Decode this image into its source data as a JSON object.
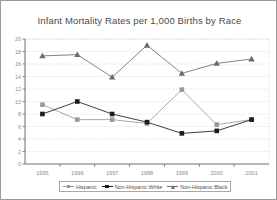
{
  "chart_data": {
    "type": "line",
    "title": "Infant Mortality Rates per 1,000 Births by Race",
    "xlabel": "",
    "ylabel": "",
    "categories": [
      "1995",
      "1996",
      "1997",
      "1998",
      "1999",
      "2000",
      "2001"
    ],
    "ylim": [
      0,
      20
    ],
    "yticks": [
      "0",
      "2",
      "4",
      "6",
      "8",
      "10",
      "12",
      "14",
      "16",
      "18",
      "20"
    ],
    "grid": true,
    "legend_position": "bottom",
    "series": [
      {
        "name": "Hispanic",
        "marker": "square",
        "color": "#9a9a9a",
        "values": [
          9.5,
          7.1,
          7.1,
          6.5,
          11.9,
          6.3,
          7.1
        ]
      },
      {
        "name": "Non-Hispanic White",
        "marker": "square",
        "color": "#1c1c1c",
        "values": [
          8.0,
          10.0,
          8.0,
          6.7,
          4.9,
          5.3,
          7.1
        ]
      },
      {
        "name": "Non-Hispanic Black",
        "marker": "triangle",
        "color": "#6b6b6b",
        "values": [
          17.3,
          17.5,
          13.9,
          19.0,
          14.5,
          16.1,
          16.8
        ]
      }
    ]
  }
}
